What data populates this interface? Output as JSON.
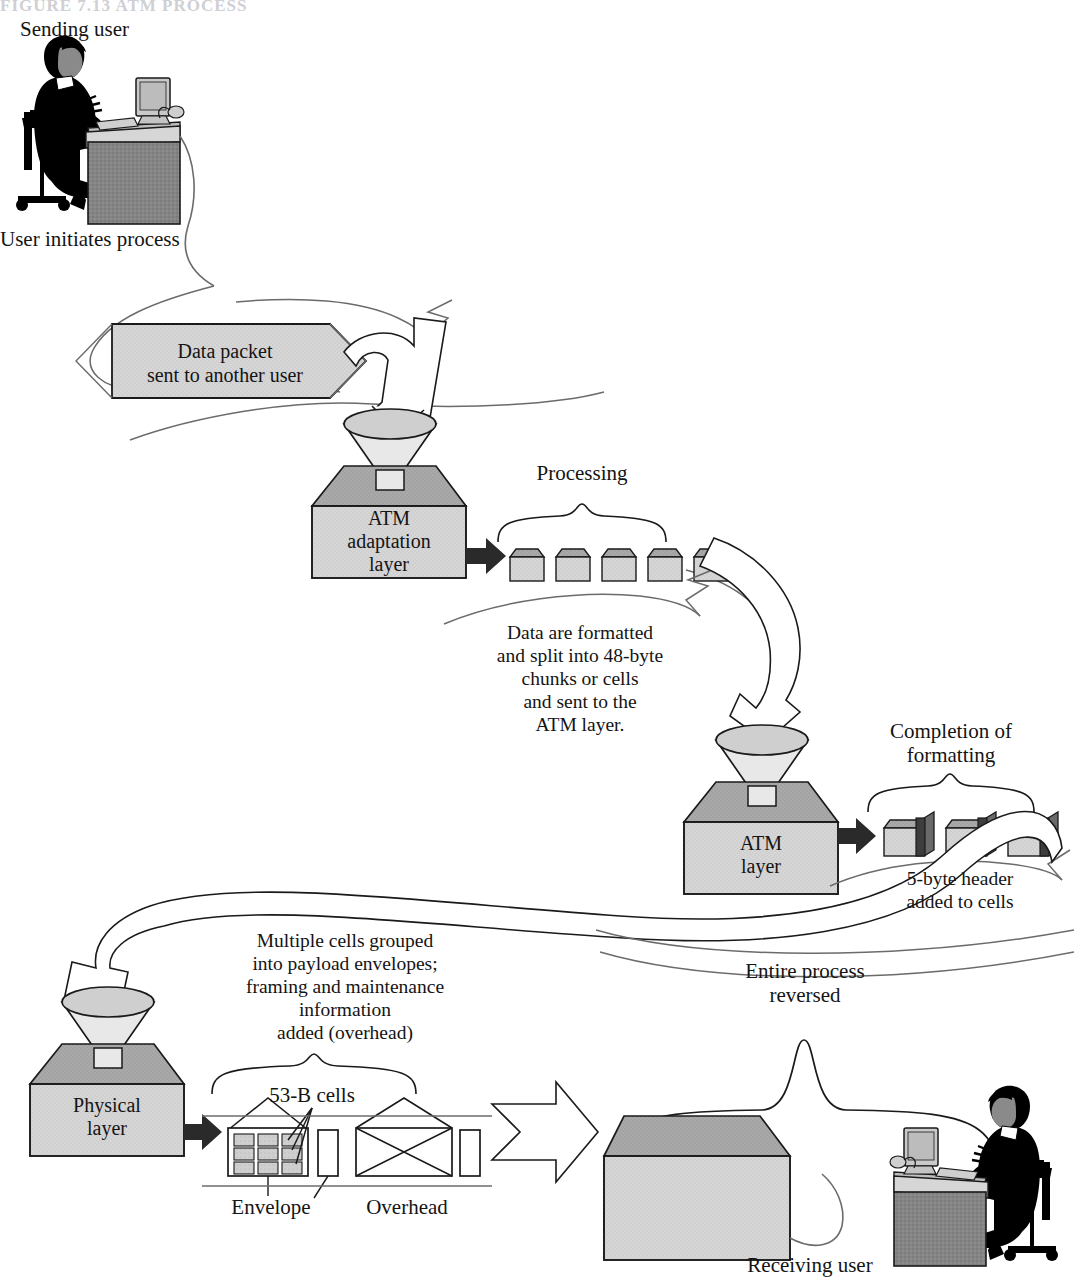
{
  "figure": {
    "title_fragment": "FIGURE 7.13   ATM PROCESS",
    "sending_user_label": "Sending user",
    "receiving_user_label": "Receiving user",
    "user_initiates_label": "User initiates process",
    "data_packet_label_line1": "Data packet",
    "data_packet_label_line2": "sent to another user"
  },
  "layers": [
    {
      "name": "aal",
      "line1": "ATM",
      "line2": "adaptation",
      "line3": "layer"
    },
    {
      "name": "atm",
      "line1": "ATM",
      "line2": "layer",
      "line3": ""
    },
    {
      "name": "physical",
      "line1": "Physical",
      "line2": "layer",
      "line3": ""
    }
  ],
  "braces": [
    {
      "name": "processing",
      "label": "Processing"
    },
    {
      "name": "completion-of-formatting",
      "line1": "Completion of",
      "line2": "formatting"
    },
    {
      "name": "entire-process-reversed",
      "line1": "Entire process",
      "line2": "reversed"
    },
    {
      "name": "physical-cells",
      "label": ""
    }
  ],
  "captions": {
    "aal": [
      "Data are formatted",
      "and split into 48-byte",
      "chunks or cells",
      "and sent to the",
      "ATM layer."
    ],
    "atm": [
      "5-byte header",
      "added to cells"
    ],
    "physical": [
      "Multiple cells grouped",
      "into payload envelopes;",
      "framing and maintenance",
      "information",
      "added (overhead)"
    ]
  },
  "physical_labels": {
    "cells": "53-B cells",
    "envelope": "Envelope",
    "overhead": "Overhead"
  },
  "cell_counts": {
    "aal_cells": 5,
    "atm_cells": 3,
    "envelope_grid_rows": 3,
    "envelope_grid_cols": 3
  },
  "colors": {
    "box_face": "#d4d4d4",
    "box_top": "#a8a8a8",
    "cell_face": "#d9d9d9",
    "cell_top": "#b4b4b4",
    "header_dark": "#555555",
    "desk": "#808080",
    "monitor": "#c9c9c9",
    "person": "#000000",
    "outline": "#1a1a1a",
    "thin_line": "#6b6b6b",
    "packet_fill": "#d8d8d8",
    "funnel_fill": "#cfcfcf",
    "arrow_dark": "#2a2a2a",
    "background": "#ffffff"
  }
}
